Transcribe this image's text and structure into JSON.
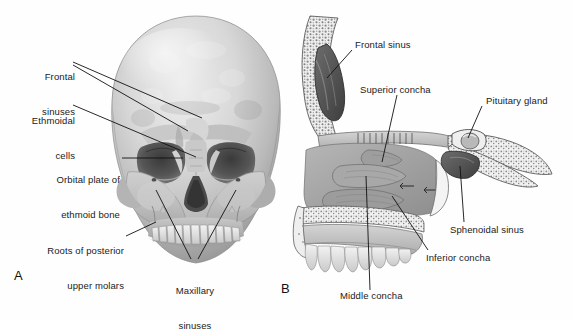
{
  "figure": {
    "background_color": "#ffffff",
    "ink_color": "#1a1a1a",
    "panels": [
      {
        "letter": "A",
        "name": "anterior-skull-view",
        "description": "Anterior view of skull showing frontal, ethmoidal and maxillary sinuses",
        "labels": [
          {
            "id": "frontal-sinuses",
            "text": "Frontal\nsinuses",
            "align": "right"
          },
          {
            "id": "ethmoidal-cells",
            "text": "Ethmoidal\ncells",
            "align": "right"
          },
          {
            "id": "orbital-plate",
            "text": "Orbital plate of\nethmoid bone",
            "align": "right"
          },
          {
            "id": "roots-molars",
            "text": "Roots of posterior\nupper molars",
            "align": "right"
          },
          {
            "id": "maxillary-sinuses",
            "text": "Maxillary\nsinuses",
            "align": "center"
          }
        ]
      },
      {
        "letter": "B",
        "name": "sagittal-section-view",
        "description": "Sagittal section of nasal cavity showing conchae, frontal and sphenoidal sinuses and pituitary gland",
        "labels": [
          {
            "id": "frontal-sinus",
            "text": "Frontal sinus",
            "align": "left"
          },
          {
            "id": "superior-concha",
            "text": "Superior concha",
            "align": "left"
          },
          {
            "id": "pituitary-gland",
            "text": "Pituitary gland",
            "align": "left"
          },
          {
            "id": "sphenoidal-sinus",
            "text": "Sphenoidal sinus",
            "align": "left"
          },
          {
            "id": "inferior-concha",
            "text": "Inferior concha",
            "align": "left"
          },
          {
            "id": "middle-concha",
            "text": "Middle concha",
            "align": "left"
          }
        ]
      }
    ],
    "label_text": {
      "frontal_sinuses_l1": "Frontal",
      "frontal_sinuses_l2": "sinuses",
      "ethmoidal_cells_l1": "Ethmoidal",
      "ethmoidal_cells_l2": "cells",
      "orbital_plate_l1": "Orbital plate of",
      "orbital_plate_l2": "ethmoid bone",
      "roots_molars_l1": "Roots of posterior",
      "roots_molars_l2": "upper molars",
      "maxillary_sinuses_l1": "Maxillary",
      "maxillary_sinuses_l2": "sinuses",
      "frontal_sinus": "Frontal sinus",
      "superior_concha": "Superior concha",
      "pituitary_gland": "Pituitary gland",
      "sphenoidal_sinus": "Sphenoidal sinus",
      "inferior_concha": "Inferior concha",
      "middle_concha": "Middle concha",
      "letter_a": "A",
      "letter_b": "B"
    }
  }
}
